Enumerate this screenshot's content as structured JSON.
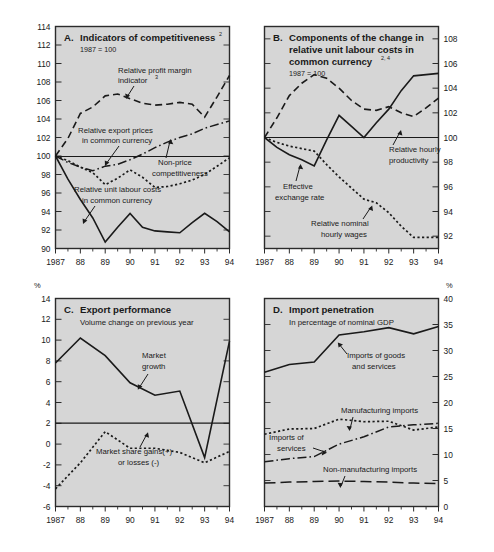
{
  "figure": {
    "panels": [
      "A",
      "B",
      "C",
      "D"
    ],
    "x_tick_labels": [
      "1987",
      "88",
      "89",
      "90",
      "91",
      "92",
      "93",
      "94"
    ],
    "background_color": "#d6d6d6",
    "line_color": "#1a1a1a"
  },
  "panelA": {
    "letter": "A.",
    "title": "Indicators of competitiveness",
    "title_sup": "2",
    "base_note": "1987 = 100",
    "y_axis_side": "left",
    "y_ticks": [
      "90",
      "92",
      "94",
      "96",
      "98",
      "100",
      "102",
      "104",
      "106",
      "108",
      "110",
      "112",
      "114"
    ],
    "annotations": [
      {
        "name": "relative-profit-margin",
        "line1": "Relative profit margin",
        "line2": "indicator",
        "sup": "3"
      },
      {
        "name": "relative-export-prices",
        "line1": "Relative export prices",
        "line2": "in common currency",
        "sup": ""
      },
      {
        "name": "non-price-competitiveness",
        "line1": "Non-price",
        "line2": "competitiveness",
        "sup": ""
      },
      {
        "name": "relative-unit-labour-costs",
        "line1": "Relative unit labour costs",
        "line2": "in common currency",
        "sup": ""
      }
    ]
  },
  "panelB": {
    "letter": "B.",
    "title_line1": "Components of the change in",
    "title_line2": "relative unit labour costs in",
    "title_line3": "common currency",
    "title_sup": "2, 4",
    "base_note": "1987 = 100",
    "y_axis_side": "right",
    "y_ticks": [
      "92",
      "94",
      "96",
      "98",
      "100",
      "102",
      "104",
      "106",
      "108"
    ],
    "annotations": [
      {
        "name": "relative-hourly-productivity",
        "line1": "Relative hourly",
        "line2": "productivity"
      },
      {
        "name": "effective-exchange-rate",
        "line1": "Effective",
        "line2": "exchange rate"
      },
      {
        "name": "relative-nominal-hourly-wages",
        "line1": "Relative nominal",
        "line2": "hourly wages"
      }
    ]
  },
  "panelC": {
    "letter": "C.",
    "title": "Export performance",
    "subtitle": "Volume change on previous year",
    "unit": "%",
    "y_axis_side": "left",
    "y_ticks": [
      "-6",
      "-4",
      "-2",
      "0",
      "2",
      "4",
      "6",
      "8",
      "10",
      "12",
      "14"
    ],
    "annotations": [
      {
        "name": "market-growth",
        "line1": "Market",
        "line2": "growth"
      },
      {
        "name": "market-share-gains",
        "line1": "Market share gains(+)",
        "line2": "or losses (-)"
      }
    ]
  },
  "panelD": {
    "letter": "D.",
    "title": "Import penetration",
    "subtitle": "In percentage of nominal GDP",
    "unit": "%",
    "y_axis_side": "right",
    "y_ticks": [
      "0",
      "5",
      "10",
      "15",
      "20",
      "25",
      "30",
      "35",
      "40"
    ],
    "annotations": [
      {
        "name": "imports-of-goods-and-services",
        "line1": "Imports of goods",
        "line2": "and services"
      },
      {
        "name": "manufacturing-imports",
        "line1": "Manufacturing imports",
        "line2": ""
      },
      {
        "name": "imports-of-services",
        "line1": "Imports of",
        "line2": "services"
      },
      {
        "name": "non-manufacturing-imports",
        "line1": "Non-manufacturing imports",
        "line2": ""
      }
    ]
  },
  "chart_data": [
    {
      "id": "A",
      "type": "line",
      "title": "A. Indicators of competitiveness (2)",
      "subtitle": "1987 = 100",
      "xlabel": "",
      "ylabel": "",
      "x": [
        1987,
        1987.5,
        1988,
        1988.5,
        1989,
        1989.5,
        1990,
        1990.5,
        1991,
        1991.5,
        1992,
        1992.5,
        1993,
        1993.5,
        1994
      ],
      "xlim": [
        1987,
        1994
      ],
      "ylim": [
        90,
        114
      ],
      "grid": false,
      "axis_side": "left",
      "tick_labels": [
        "1987",
        "88",
        "89",
        "90",
        "91",
        "92",
        "93",
        "94"
      ],
      "series": [
        {
          "name": "Relative profit margin indicator",
          "style": "dashed",
          "values": [
            100.0,
            101.9,
            104.6,
            105.3,
            106.5,
            106.7,
            106.2,
            105.7,
            105.5,
            105.6,
            105.8,
            105.6,
            104.2,
            106.4,
            108.7
          ]
        },
        {
          "name": "Relative export prices in common currency",
          "style": "dashdot",
          "values": [
            100.0,
            99.3,
            98.8,
            98.4,
            98.9,
            99.1,
            99.6,
            100.2,
            100.9,
            101.5,
            102.0,
            102.4,
            103.0,
            103.4,
            103.8
          ]
        },
        {
          "name": "Non-price competitiveness",
          "style": "dotted",
          "values": [
            100.0,
            99.5,
            98.8,
            98.2,
            96.9,
            97.6,
            98.5,
            97.7,
            96.6,
            96.7,
            97.0,
            97.4,
            98.0,
            98.9,
            99.8
          ]
        },
        {
          "name": "Relative unit labour costs in common currency",
          "style": "solid",
          "values": [
            100.0,
            97.5,
            95.3,
            93.3,
            90.7,
            92.3,
            93.8,
            92.3,
            91.9,
            91.8,
            91.7,
            92.8,
            93.8,
            92.9,
            91.8
          ]
        }
      ]
    },
    {
      "id": "B",
      "type": "line",
      "title": "B. Components of the change in relative unit labour costs in common currency (2, 4)",
      "subtitle": "1987 = 100",
      "xlabel": "",
      "ylabel": "",
      "x": [
        1987,
        1987.5,
        1988,
        1988.5,
        1989,
        1989.5,
        1990,
        1990.5,
        1991,
        1991.5,
        1992,
        1992.5,
        1993,
        1993.5,
        1994
      ],
      "xlim": [
        1987,
        1994
      ],
      "ylim": [
        91,
        109
      ],
      "grid": false,
      "axis_side": "right",
      "tick_labels": [
        "1987",
        "88",
        "89",
        "90",
        "91",
        "92",
        "93",
        "94"
      ],
      "series": [
        {
          "name": "Relative hourly productivity",
          "style": "dashed",
          "values": [
            100.0,
            101.6,
            103.4,
            104.4,
            105.1,
            104.8,
            104.0,
            103.0,
            102.3,
            102.2,
            102.5,
            102.0,
            101.7,
            102.4,
            103.2
          ]
        },
        {
          "name": "Effective exchange rate",
          "style": "solid",
          "values": [
            100.0,
            99.2,
            98.6,
            98.2,
            97.7,
            99.8,
            101.8,
            100.9,
            100.0,
            101.2,
            102.3,
            103.8,
            105.0,
            105.1,
            105.2
          ]
        },
        {
          "name": "Relative nominal hourly wages",
          "style": "dotted",
          "values": [
            100.0,
            99.6,
            99.3,
            99.1,
            98.9,
            97.8,
            96.8,
            95.9,
            95.0,
            94.7,
            93.9,
            92.8,
            91.9,
            91.9,
            91.9
          ]
        }
      ]
    },
    {
      "id": "C",
      "type": "line",
      "title": "C. Export performance",
      "subtitle": "Volume change on previous year",
      "xlabel": "",
      "ylabel": "%",
      "x": [
        1987,
        1988,
        1989,
        1990,
        1991,
        1992,
        1993,
        1994
      ],
      "xlim": [
        1987,
        1994
      ],
      "ylim": [
        -6,
        14
      ],
      "grid": false,
      "axis_side": "left",
      "tick_labels": [
        "1987",
        "88",
        "89",
        "90",
        "91",
        "92",
        "93",
        "94"
      ],
      "series": [
        {
          "name": "Market growth",
          "style": "solid",
          "values": [
            7.8,
            10.2,
            8.5,
            5.9,
            4.7,
            5.1,
            -1.3,
            9.9
          ]
        },
        {
          "name": "Market share gains(+) or losses (-)",
          "style": "dotted",
          "values": [
            -4.3,
            -1.8,
            1.2,
            -0.4,
            -0.4,
            -0.8,
            -1.8,
            -0.7
          ]
        }
      ]
    },
    {
      "id": "D",
      "type": "line",
      "title": "D. Import penetration",
      "subtitle": "In percentage of nominal GDP",
      "xlabel": "",
      "ylabel": "%",
      "x": [
        1987,
        1988,
        1989,
        1990,
        1991,
        1992,
        1993,
        1994
      ],
      "xlim": [
        1987,
        1994
      ],
      "ylim": [
        0,
        40
      ],
      "grid": false,
      "axis_side": "right",
      "tick_labels": [
        "1987",
        "88",
        "89",
        "90",
        "91",
        "92",
        "93",
        "94"
      ],
      "series": [
        {
          "name": "Imports of goods and services",
          "style": "solid",
          "values": [
            25.8,
            27.3,
            27.8,
            33.0,
            33.6,
            34.4,
            33.2,
            34.6
          ]
        },
        {
          "name": "Manufacturing imports",
          "style": "dotted",
          "values": [
            13.9,
            14.9,
            15.0,
            16.8,
            16.3,
            16.4,
            14.7,
            15.3
          ]
        },
        {
          "name": "Imports of services",
          "style": "dashdot",
          "values": [
            8.6,
            9.2,
            9.6,
            12.0,
            13.4,
            15.3,
            15.7,
            16.0
          ]
        },
        {
          "name": "Non-manufacturing imports",
          "style": "longdash",
          "values": [
            4.5,
            4.7,
            4.8,
            4.9,
            4.8,
            4.7,
            4.5,
            4.4
          ]
        }
      ]
    }
  ]
}
